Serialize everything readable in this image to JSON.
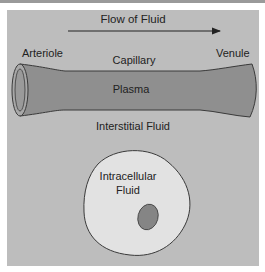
{
  "diagram": {
    "title": "Flow of Fluid",
    "labels": {
      "arteriole": "Arteriole",
      "venule": "Venule",
      "capillary": "Capillary",
      "plasma": "Plasma",
      "interstitial": "Interstitial Fluid",
      "intracellular_line1": "Intracellular",
      "intracellular_line2": "Fluid"
    },
    "colors": {
      "background_panel": "#bdbdbd",
      "vessel_fill": "#8f8f8f",
      "vessel_stroke": "#3a3a3a",
      "cell_fill": "#e2e2e2",
      "nucleus_fill": "#858585",
      "text": "#222222"
    }
  }
}
